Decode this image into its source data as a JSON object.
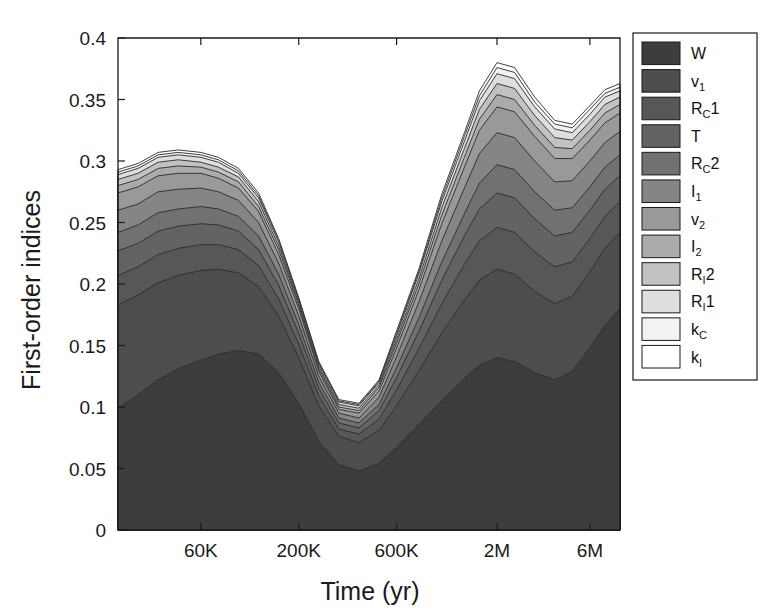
{
  "chart_data": {
    "type": "area",
    "stacked": true,
    "title": "",
    "xlabel": "Time (yr)",
    "ylabel": "First-order indices",
    "ylim": [
      0,
      0.4
    ],
    "yticks": [
      0,
      0.05,
      0.1,
      0.15,
      0.2,
      0.25,
      0.3,
      0.35,
      0.4
    ],
    "ytick_labels": [
      "0",
      "0.05",
      "0.1",
      "0.15",
      "0.2",
      "0.25",
      "0.3",
      "0.35",
      "0.4"
    ],
    "xtick_labels": [
      "60K",
      "200K",
      "600K",
      "2M",
      "6M"
    ],
    "xtick_positions": [
      0.165,
      0.36,
      0.555,
      0.755,
      0.94
    ],
    "grid": false,
    "legend_position": "right-outside",
    "x": [
      0.0,
      0.04,
      0.08,
      0.12,
      0.165,
      0.2,
      0.24,
      0.28,
      0.32,
      0.36,
      0.4,
      0.44,
      0.48,
      0.52,
      0.555,
      0.6,
      0.645,
      0.69,
      0.72,
      0.755,
      0.79,
      0.83,
      0.87,
      0.905,
      0.94,
      0.97,
      1.0
    ],
    "series": [
      {
        "name": "W",
        "color": "#3d3d3d",
        "values": [
          0.099,
          0.11,
          0.122,
          0.131,
          0.138,
          0.143,
          0.146,
          0.143,
          0.128,
          0.103,
          0.072,
          0.053,
          0.048,
          0.054,
          0.067,
          0.086,
          0.105,
          0.123,
          0.134,
          0.14,
          0.137,
          0.128,
          0.122,
          0.129,
          0.148,
          0.166,
          0.18
        ]
      },
      {
        "name": "v1",
        "color": "#4d4d4d",
        "values": [
          0.084,
          0.081,
          0.079,
          0.076,
          0.073,
          0.069,
          0.063,
          0.055,
          0.046,
          0.037,
          0.029,
          0.023,
          0.023,
          0.027,
          0.034,
          0.044,
          0.055,
          0.064,
          0.069,
          0.072,
          0.071,
          0.066,
          0.062,
          0.061,
          0.062,
          0.063,
          0.062
        ]
      },
      {
        "name": "RC1",
        "color": "#575757",
        "values": [
          0.024,
          0.023,
          0.023,
          0.022,
          0.021,
          0.02,
          0.019,
          0.017,
          0.014,
          0.011,
          0.008,
          0.006,
          0.007,
          0.009,
          0.013,
          0.018,
          0.024,
          0.029,
          0.032,
          0.034,
          0.034,
          0.032,
          0.03,
          0.028,
          0.027,
          0.026,
          0.025
        ]
      },
      {
        "name": "T",
        "color": "#636363",
        "values": [
          0.02,
          0.019,
          0.019,
          0.018,
          0.017,
          0.016,
          0.015,
          0.013,
          0.011,
          0.009,
          0.006,
          0.005,
          0.005,
          0.007,
          0.01,
          0.014,
          0.019,
          0.023,
          0.026,
          0.028,
          0.028,
          0.027,
          0.025,
          0.024,
          0.023,
          0.022,
          0.021
        ]
      },
      {
        "name": "RC2",
        "color": "#717171",
        "values": [
          0.015,
          0.015,
          0.015,
          0.014,
          0.014,
          0.013,
          0.012,
          0.011,
          0.009,
          0.007,
          0.005,
          0.004,
          0.004,
          0.005,
          0.008,
          0.011,
          0.015,
          0.018,
          0.021,
          0.023,
          0.023,
          0.022,
          0.021,
          0.02,
          0.019,
          0.018,
          0.017
        ]
      },
      {
        "name": "I1",
        "color": "#858585",
        "values": [
          0.018,
          0.017,
          0.017,
          0.016,
          0.015,
          0.014,
          0.013,
          0.011,
          0.009,
          0.007,
          0.005,
          0.004,
          0.004,
          0.006,
          0.009,
          0.013,
          0.017,
          0.021,
          0.024,
          0.026,
          0.026,
          0.025,
          0.023,
          0.022,
          0.021,
          0.02,
          0.019
        ]
      },
      {
        "name": "v2",
        "color": "#999999",
        "values": [
          0.014,
          0.014,
          0.013,
          0.013,
          0.012,
          0.011,
          0.01,
          0.009,
          0.007,
          0.006,
          0.004,
          0.003,
          0.004,
          0.005,
          0.007,
          0.01,
          0.014,
          0.017,
          0.019,
          0.021,
          0.021,
          0.02,
          0.019,
          0.018,
          0.017,
          0.016,
          0.015
        ]
      },
      {
        "name": "I2",
        "color": "#ababab",
        "values": [
          0.006,
          0.006,
          0.006,
          0.006,
          0.005,
          0.005,
          0.005,
          0.004,
          0.004,
          0.003,
          0.002,
          0.002,
          0.002,
          0.003,
          0.004,
          0.005,
          0.007,
          0.008,
          0.009,
          0.01,
          0.01,
          0.009,
          0.009,
          0.008,
          0.008,
          0.008,
          0.007
        ]
      },
      {
        "name": "RI2",
        "color": "#c2c2c2",
        "values": [
          0.005,
          0.005,
          0.005,
          0.005,
          0.004,
          0.004,
          0.004,
          0.004,
          0.003,
          0.002,
          0.002,
          0.002,
          0.002,
          0.002,
          0.003,
          0.004,
          0.006,
          0.007,
          0.008,
          0.009,
          0.009,
          0.008,
          0.008,
          0.007,
          0.007,
          0.007,
          0.006
        ]
      },
      {
        "name": "RI1",
        "color": "#dedede",
        "values": [
          0.004,
          0.004,
          0.004,
          0.004,
          0.004,
          0.004,
          0.003,
          0.003,
          0.003,
          0.002,
          0.002,
          0.002,
          0.002,
          0.002,
          0.003,
          0.004,
          0.005,
          0.006,
          0.007,
          0.008,
          0.008,
          0.007,
          0.007,
          0.006,
          0.006,
          0.006,
          0.005
        ]
      },
      {
        "name": "kC",
        "color": "#f2f2f2",
        "values": [
          0.002,
          0.002,
          0.002,
          0.002,
          0.002,
          0.002,
          0.002,
          0.002,
          0.002,
          0.001,
          0.001,
          0.001,
          0.001,
          0.001,
          0.002,
          0.002,
          0.003,
          0.004,
          0.004,
          0.005,
          0.005,
          0.004,
          0.004,
          0.004,
          0.004,
          0.003,
          0.003
        ]
      },
      {
        "name": "kI",
        "color": "#ffffff",
        "values": [
          0.002,
          0.002,
          0.002,
          0.002,
          0.002,
          0.002,
          0.002,
          0.002,
          0.001,
          0.001,
          0.001,
          0.001,
          0.001,
          0.001,
          0.002,
          0.002,
          0.003,
          0.003,
          0.004,
          0.004,
          0.004,
          0.004,
          0.003,
          0.003,
          0.003,
          0.003,
          0.003
        ]
      }
    ]
  },
  "axes": {
    "ylabel": "First-order indices",
    "xlabel": "Time (yr)",
    "ytick_labels": [
      "0.4",
      "0.35",
      "0.3",
      "0.25",
      "0.2",
      "0.15",
      "0.1",
      "0.05",
      "0"
    ],
    "xtick_labels": [
      "60K",
      "200K",
      "600K",
      "2M",
      "6M"
    ]
  },
  "legend": {
    "items": [
      {
        "label": "W",
        "base": "W",
        "sub": "",
        "sup": "",
        "color": "#3d3d3d"
      },
      {
        "label": "v1",
        "base": "v",
        "sub": "1",
        "sup": "",
        "color": "#4d4d4d"
      },
      {
        "label": "RC1",
        "base": "R",
        "sub": "C",
        "sup": "1",
        "color": "#575757"
      },
      {
        "label": "T",
        "base": "T",
        "sub": "",
        "sup": "",
        "color": "#636363"
      },
      {
        "label": "RC2",
        "base": "R",
        "sub": "C",
        "sup": "2",
        "color": "#717171"
      },
      {
        "label": "I1",
        "base": "I",
        "sub": "1",
        "sup": "",
        "color": "#858585"
      },
      {
        "label": "v2",
        "base": "v",
        "sub": "2",
        "sup": "",
        "color": "#999999"
      },
      {
        "label": "I2",
        "base": "I",
        "sub": "2",
        "sup": "",
        "color": "#ababab"
      },
      {
        "label": "RI2",
        "base": "R",
        "sub": "I",
        "sup": "2",
        "color": "#c2c2c2"
      },
      {
        "label": "RI1",
        "base": "R",
        "sub": "I",
        "sup": "1",
        "color": "#dedede"
      },
      {
        "label": "kC",
        "base": "k",
        "sub": "C",
        "sup": "",
        "color": "#f2f2f2"
      },
      {
        "label": "kI",
        "base": "k",
        "sub": "I",
        "sup": "",
        "color": "#ffffff"
      }
    ]
  }
}
